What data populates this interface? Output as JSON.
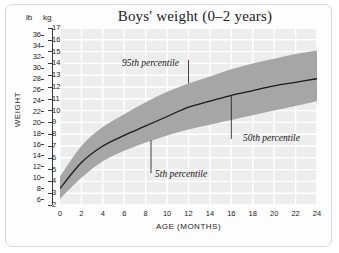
{
  "chart_data": {
    "type": "area",
    "title": "Boys' weight (0–2 years)",
    "xlabel": "AGE (MONTHS)",
    "ylabel": "WEIGHT",
    "grid": true,
    "legend": "none",
    "xlim": [
      0,
      24
    ],
    "xticks": [
      0,
      2,
      4,
      6,
      8,
      10,
      12,
      14,
      16,
      18,
      20,
      22,
      24
    ],
    "y_axes": [
      {
        "name": "lb",
        "unit_label": "lb",
        "side": "left",
        "lim": [
          5,
          37.25
        ],
        "ticks": [
          6,
          8,
          10,
          12,
          14,
          16,
          18,
          20,
          22,
          24,
          26,
          28,
          30,
          32,
          34,
          36
        ]
      },
      {
        "name": "kg",
        "unit_label": "kg",
        "side": "left-inner",
        "lim": [
          2,
          17
        ],
        "ticks": [
          2,
          3,
          4,
          5,
          6,
          7,
          8,
          9,
          10,
          11,
          12,
          13,
          14,
          15,
          16,
          17
        ]
      }
    ],
    "x": [
      0,
      2,
      4,
      6,
      8,
      10,
      12,
      14,
      16,
      18,
      20,
      22,
      24
    ],
    "series": [
      {
        "name": "5th percentile",
        "unit": "kg",
        "values": [
          2.5,
          4.3,
          5.7,
          6.6,
          7.3,
          7.9,
          8.4,
          8.8,
          9.2,
          9.6,
          10.0,
          10.4,
          10.8
        ]
      },
      {
        "name": "50th percentile",
        "unit": "kg",
        "values": [
          3.4,
          5.6,
          7.0,
          7.9,
          8.7,
          9.5,
          10.3,
          10.8,
          11.3,
          11.7,
          12.1,
          12.4,
          12.7
        ]
      },
      {
        "name": "95th percentile",
        "unit": "kg",
        "values": [
          4.4,
          7.0,
          8.6,
          9.7,
          10.7,
          11.6,
          12.3,
          12.9,
          13.5,
          14.0,
          14.4,
          14.8,
          15.1
        ]
      }
    ],
    "annotations": [
      {
        "label": "95th percentile",
        "points_to_x": 12.0,
        "points_to_y_kg": 12.3
      },
      {
        "label": "50th percentile",
        "points_to_x": 16.0,
        "points_to_y_kg": 11.3
      },
      {
        "label": "5th percentile",
        "points_to_x": 8.5,
        "points_to_y_kg": 7.5
      }
    ],
    "colors": {
      "band": "#a6a6a6",
      "median_line": "#1a1a1a",
      "plot_background": "#ededed",
      "gridline": "#ffffff",
      "text": "#1c1c1c",
      "frame": "#d9d9d9"
    }
  }
}
